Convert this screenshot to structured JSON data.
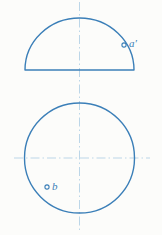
{
  "drawing": {
    "title": "Orthographic projection: hemisphere front view and circular top view",
    "background_color": "#fcfcfa",
    "line_color": "#3b7fb8",
    "centerline_color": "#bcd6e8",
    "line_width": 1.4,
    "centerline_width": 1.0,
    "width": 162,
    "height": 235
  },
  "views": {
    "front_view": {
      "name": "front-view-semicircle",
      "shape": "semicircle",
      "center_x": 79.5,
      "base_y": 70,
      "radius": 54.5,
      "apex_y": 18,
      "base_left_x": 25,
      "base_right_x": 134
    },
    "top_view": {
      "name": "top-view-circle",
      "shape": "circle",
      "center_x": 79.5,
      "center_y": 158,
      "radius": 55,
      "top_y": 103,
      "bottom_y": 213,
      "left_x": 25,
      "right_x": 134
    }
  },
  "centerlines": {
    "vertical": {
      "name": "vertical-centerline",
      "x": 79.5,
      "y_start": 2,
      "y_end": 232,
      "style": "dash-dot"
    },
    "horizontal": {
      "name": "horizontal-centerline",
      "y": 158,
      "x_start": 14,
      "x_end": 150,
      "style": "dash-dot"
    }
  },
  "points": [
    {
      "id": "a-prime",
      "label": "a′",
      "marker": "open-circle",
      "marker_x": 124,
      "marker_y": 45,
      "marker_radius": 2.1,
      "view": "front_view",
      "label_x": 129,
      "label_y": 38
    },
    {
      "id": "b",
      "label": "b",
      "marker": "open-circle",
      "marker_x": 47,
      "marker_y": 187,
      "marker_radius": 2.1,
      "view": "top_view",
      "label_x": 52,
      "label_y": 181
    }
  ]
}
